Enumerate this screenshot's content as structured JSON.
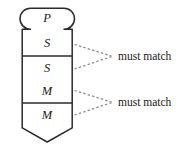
{
  "diagram": {
    "type": "labeled-segmented-shape",
    "title": "",
    "shape": {
      "name": "rounded-head-pointed-tail-bar",
      "head_label": "P",
      "outline_color": "#2b2b2b",
      "fill_color": "#ffffff",
      "divider_color": "#2b2b2b"
    },
    "cells": [
      {
        "id": "cell-1",
        "letters": [
          "P",
          "S"
        ],
        "top": 8,
        "bottom": 56
      },
      {
        "id": "cell-2",
        "letters": [
          "S",
          "M"
        ],
        "top": 56,
        "bottom": 103
      },
      {
        "id": "cell-3",
        "letters": [
          "M"
        ],
        "top": 103,
        "bottom": 128
      }
    ],
    "letters": [
      {
        "id": "letter-p",
        "text": "P",
        "x": 47,
        "y": 22
      },
      {
        "id": "letter-s-1",
        "text": "S",
        "x": 47,
        "y": 47
      },
      {
        "id": "letter-s-2",
        "text": "S",
        "x": 47,
        "y": 72
      },
      {
        "id": "letter-m-1",
        "text": "M",
        "x": 47,
        "y": 95
      },
      {
        "id": "letter-m-2",
        "text": "M",
        "x": 47,
        "y": 119
      }
    ],
    "annotations": [
      {
        "id": "annotation-1",
        "text": "must match",
        "leader_color": "#8c8c8c",
        "text_x": 118,
        "text_y": 60,
        "apex_x": 112,
        "apex_y": 56,
        "from_top_x": 74,
        "from_top_y": 44,
        "from_bottom_x": 74,
        "from_bottom_y": 69
      },
      {
        "id": "annotation-2",
        "text": "must match",
        "leader_color": "#8c8c8c",
        "text_x": 118,
        "text_y": 106,
        "apex_x": 112,
        "apex_y": 102,
        "from_top_x": 74,
        "from_top_y": 90,
        "from_bottom_x": 74,
        "from_bottom_y": 115
      }
    ]
  }
}
